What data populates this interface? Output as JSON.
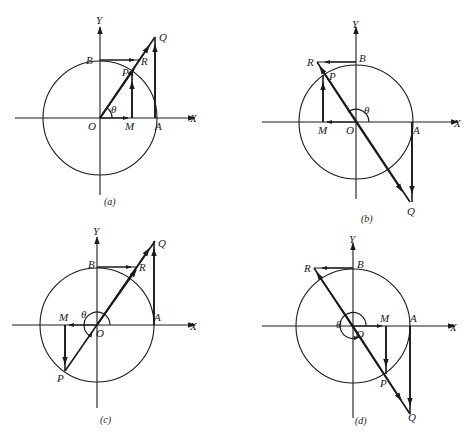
{
  "figure": {
    "ink_color": "#1a1a1a",
    "background_color": "#ffffff"
  },
  "panels": [
    {
      "id": "a",
      "caption": "(a)",
      "quadrant": 1,
      "labels": {
        "x_axis": "X",
        "y_axis": "Y",
        "origin": "O",
        "A": "A",
        "B": "B",
        "P": "P",
        "Q": "Q",
        "R": "R",
        "M": "M",
        "angle": "θ"
      }
    },
    {
      "id": "b",
      "caption": "(b)",
      "quadrant": 2,
      "labels": {
        "x_axis": "X",
        "y_axis": "Y",
        "origin": "O",
        "A": "A",
        "B": "B",
        "P": "P",
        "Q": "Q",
        "R": "R",
        "M": "M",
        "angle": "θ"
      }
    },
    {
      "id": "c",
      "caption": "(c)",
      "quadrant": 3,
      "labels": {
        "x_axis": "X",
        "y_axis": "Y",
        "origin": "O",
        "A": "A",
        "B": "B",
        "P": "P",
        "Q": "Q",
        "R": "R",
        "M": "M",
        "angle": "θ"
      }
    },
    {
      "id": "d",
      "caption": "(d)",
      "quadrant": 4,
      "labels": {
        "x_axis": "X",
        "y_axis": "Y",
        "origin": "O",
        "A": "A",
        "B": "B",
        "P": "P",
        "Q": "Q",
        "R": "R",
        "M": "M",
        "angle": "θ"
      }
    }
  ]
}
